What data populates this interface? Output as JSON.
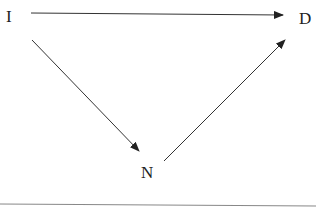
{
  "diagram": {
    "nodes": [
      {
        "id": "I",
        "label": "I"
      },
      {
        "id": "D",
        "label": "D"
      },
      {
        "id": "N",
        "label": "N"
      }
    ],
    "edges": [
      {
        "from": "I",
        "to": "D"
      },
      {
        "from": "I",
        "to": "N"
      },
      {
        "from": "N",
        "to": "D"
      }
    ],
    "colors": {
      "stroke": "#333333",
      "rule": "#888888"
    }
  }
}
